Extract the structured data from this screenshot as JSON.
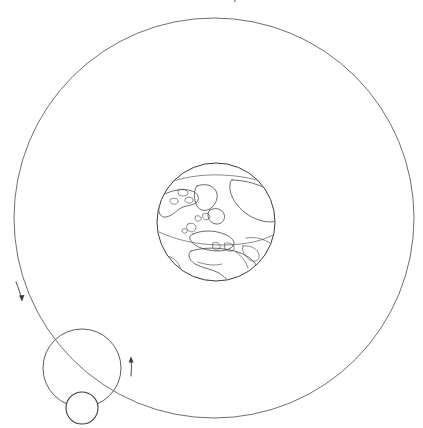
{
  "figure": {
    "title": "The Earth at the Hill-sphere limits",
    "background_color": "#ffffff",
    "width": 423,
    "height": 428
  },
  "diagram": {
    "type": "orbital-schematic",
    "line_color": "#5f5f5f",
    "body_outline_color": "#3c3c3c",
    "elements": [
      {
        "name": "outer-orbit",
        "kind": "circle",
        "label": "outer orbit circle",
        "cx": 214,
        "cy": 218,
        "r": 200
      },
      {
        "name": "earth-globe",
        "kind": "planet",
        "label": "Earth",
        "cx": 216,
        "cy": 222,
        "r": 59,
        "features": [
          "North America",
          "Greenland",
          "Europe",
          "Africa",
          "Arctic"
        ]
      },
      {
        "name": "inner-orbit",
        "kind": "circle",
        "label": "inner orbit circle",
        "cx": 82,
        "cy": 368,
        "r": 39
      },
      {
        "name": "orbiting-body",
        "kind": "circle",
        "label": "orbiting body",
        "cx": 82,
        "cy": 408,
        "r": 16
      }
    ],
    "arrows": [
      {
        "name": "outer-orbit-direction-arrow",
        "label": "direction of motion on outer orbit",
        "x": 20,
        "y": 295
      },
      {
        "name": "inner-orbit-direction-arrow",
        "label": "direction of motion on inner orbit",
        "x": 131,
        "y": 366
      }
    ]
  }
}
